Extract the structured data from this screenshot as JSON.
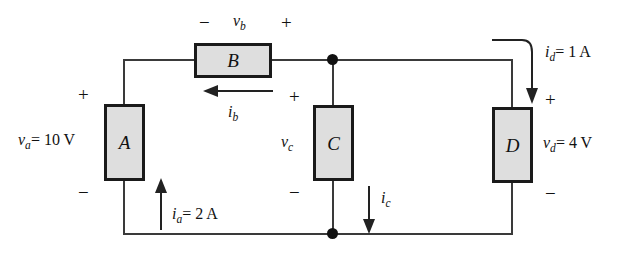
{
  "figure": {
    "type": "circuit-diagram"
  },
  "blocks": [
    {
      "id": "A",
      "label": "A",
      "x": 104,
      "y": 104,
      "w": 41,
      "h": 77
    },
    {
      "id": "B",
      "label": "B",
      "x": 194,
      "y": 43,
      "w": 78,
      "h": 35
    },
    {
      "id": "C",
      "label": "C",
      "x": 313,
      "y": 105,
      "w": 41,
      "h": 76
    },
    {
      "id": "D",
      "label": "D",
      "x": 492,
      "y": 107,
      "w": 41,
      "h": 76
    }
  ],
  "voltage_labels": [
    {
      "id": "va",
      "var": "v",
      "sub": "a",
      "value": "= 10 V",
      "full": "va = 10 V",
      "polarity_top": "+",
      "polarity_bottom": "−"
    },
    {
      "id": "vb",
      "var": "v",
      "sub": "b",
      "value": "",
      "full": "vb",
      "polarity_left": "−",
      "polarity_right": "+"
    },
    {
      "id": "vc",
      "var": "v",
      "sub": "c",
      "value": "",
      "full": "vc",
      "polarity_top": "+",
      "polarity_bottom": "−"
    },
    {
      "id": "vd",
      "var": "v",
      "sub": "d",
      "value": "= 4 V",
      "full": "vd = 4 V",
      "polarity_top": "+",
      "polarity_bottom": "−"
    }
  ],
  "current_labels": [
    {
      "id": "ia",
      "var": "i",
      "sub": "a",
      "value": "= 2 A",
      "direction": "up"
    },
    {
      "id": "ib",
      "var": "i",
      "sub": "b",
      "value": "",
      "direction": "left"
    },
    {
      "id": "ic",
      "var": "i",
      "sub": "c",
      "value": "",
      "direction": "down"
    },
    {
      "id": "id",
      "var": "i",
      "sub": "d",
      "value": "= 1 A",
      "direction": "down-curved"
    }
  ],
  "signs": {
    "va_plus": "+",
    "va_minus": "−",
    "vb_minus": "−",
    "vb_plus": "+",
    "vc_plus": "+",
    "vc_minus": "−",
    "vd_plus": "+",
    "vd_minus": "−"
  },
  "colors": {
    "wire": "#3a3a3a",
    "block_fill": "#dedede",
    "block_border": "#1a1a1a",
    "text": "#111111",
    "background": "#ffffff"
  }
}
